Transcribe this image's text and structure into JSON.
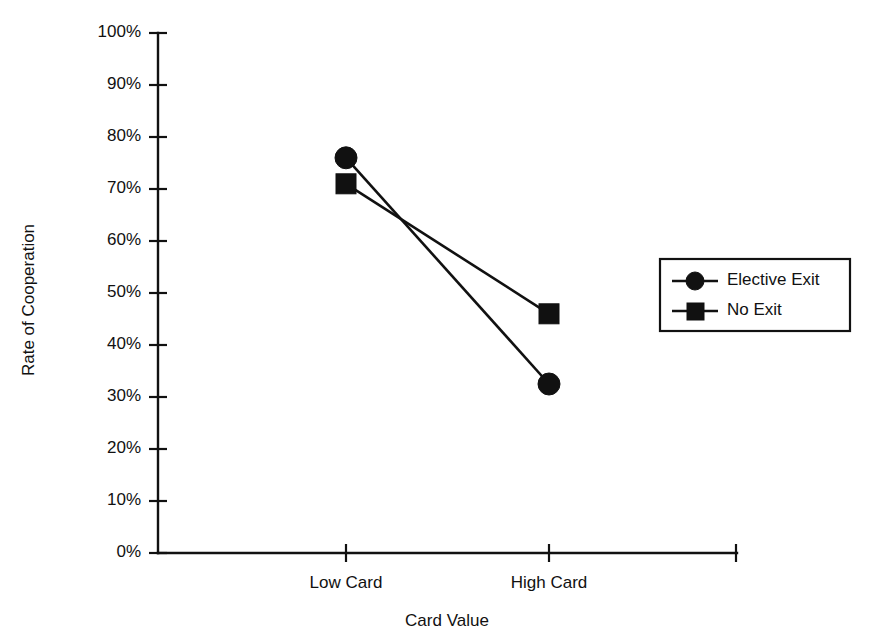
{
  "chart_data": {
    "type": "line",
    "title": "",
    "subtitle": "",
    "xlabel": "Card Value",
    "ylabel": "Rate of Cooperation",
    "categories": [
      "Low Card",
      "High Card"
    ],
    "x": [
      0,
      1
    ],
    "xlim": [
      0,
      1
    ],
    "ylim": [
      0,
      100
    ],
    "y_unit": "%",
    "y_ticks": [
      0,
      10,
      20,
      30,
      40,
      50,
      60,
      70,
      80,
      90,
      100
    ],
    "y_tick_labels": [
      "0%",
      "10%",
      "20%",
      "30%",
      "40%",
      "50%",
      "60%",
      "70%",
      "80%",
      "90%",
      "100%"
    ],
    "x_tick_labels": [
      "Low Card",
      "High Card"
    ],
    "grid": false,
    "legend_position": "right",
    "series": [
      {
        "name": "Elective Exit",
        "marker": "circle",
        "color": "#111111",
        "values": [
          76.0,
          32.5
        ]
      },
      {
        "name": "No Exit",
        "marker": "square",
        "color": "#111111",
        "values": [
          71.0,
          46.0
        ]
      }
    ]
  },
  "axes": {
    "y_axis_title": "Rate of Cooperation",
    "x_axis_title": "Card Value",
    "y_tick_labels": [
      "100%",
      "90%",
      "80%",
      "70%",
      "60%",
      "50%",
      "40%",
      "30%",
      "20%",
      "10%",
      "0%"
    ],
    "x_tick_labels": [
      "Low Card",
      "High Card"
    ]
  },
  "legend": {
    "entries": [
      {
        "label": "Elective Exit",
        "marker": "circle-marker-icon"
      },
      {
        "label": "No Exit",
        "marker": "square-marker-icon"
      }
    ]
  },
  "colors": {
    "ink": "#111111",
    "background": "#ffffff"
  }
}
